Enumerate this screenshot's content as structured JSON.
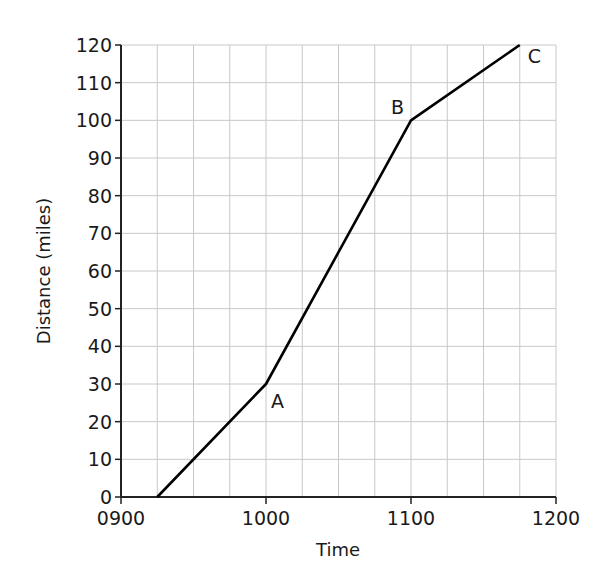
{
  "chart_data": {
    "type": "line",
    "title": "",
    "xlabel": "Time",
    "ylabel": "Distance (miles)",
    "x_ticks": [
      "0900",
      "1000",
      "1100",
      "1200"
    ],
    "x_tick_minutes": [
      0,
      60,
      120,
      180
    ],
    "y_ticks": [
      0,
      10,
      20,
      30,
      40,
      50,
      60,
      70,
      80,
      90,
      100,
      110,
      120
    ],
    "xlim_minutes_from_0900": [
      0,
      180
    ],
    "ylim": [
      0,
      120
    ],
    "grid": true,
    "grid_x_step_minutes": 15,
    "grid_y_step": 10,
    "legend": null,
    "series": [
      {
        "name": "Journey",
        "color": "#000000",
        "points": [
          {
            "time": "0915",
            "minutes": 15,
            "distance": 0,
            "label": ""
          },
          {
            "time": "1000",
            "minutes": 60,
            "distance": 30,
            "label": "A"
          },
          {
            "time": "1100",
            "minutes": 120,
            "distance": 100,
            "label": "B"
          },
          {
            "time": "1145",
            "minutes": 165,
            "distance": 120,
            "label": "C"
          }
        ]
      }
    ],
    "annotations": [
      {
        "text": "A",
        "minutes": 60,
        "distance": 30,
        "position": "below-right"
      },
      {
        "text": "B",
        "minutes": 120,
        "distance": 100,
        "position": "above-left"
      },
      {
        "text": "C",
        "minutes": 165,
        "distance": 120,
        "position": "right"
      }
    ]
  },
  "style": {
    "grid_color": "#c8c8c8",
    "axis_color": "#222222",
    "line_color": "#000000"
  }
}
